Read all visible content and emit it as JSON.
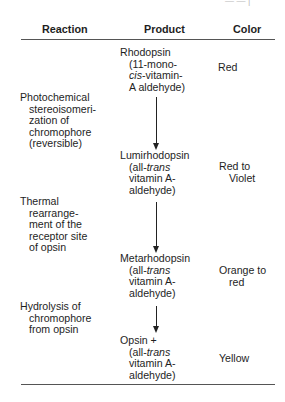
{
  "table": {
    "headers": {
      "reaction": "Reaction",
      "product": "Product",
      "color": "Color"
    },
    "products": [
      {
        "name": "Rhodopsin",
        "detail": [
          "(11-mono-",
          "cis-vitamin-",
          "A aldehyde)"
        ],
        "detail_italic_prefix": "cis",
        "color": [
          "Red"
        ]
      },
      {
        "name": "Lumirhodopsin",
        "detail": [
          "(all-trans",
          "vitamin A-",
          "aldehyde)"
        ],
        "color": [
          "Red to",
          "Violet"
        ]
      },
      {
        "name": "Metarhodopsin",
        "detail": [
          "(all-trans",
          "vitamin A-",
          "aldehyde)"
        ],
        "color": [
          "Orange to",
          "red"
        ]
      },
      {
        "name": "Opsin +",
        "detail": [
          "(all-trans",
          "vitamin A-",
          "aldehyde)"
        ],
        "color": [
          "Yellow"
        ]
      }
    ],
    "reactions": [
      {
        "lines": [
          "Photochemical",
          "stereoisomeri-",
          "zation of",
          "chromophore",
          "(reversible)"
        ]
      },
      {
        "lines": [
          "Thermal",
          "rearrange-",
          "ment of the",
          "receptor site",
          "of opsin"
        ]
      },
      {
        "lines": [
          "Hydrolysis of",
          "chromophore",
          "from opsin"
        ]
      }
    ],
    "italic_words": {
      "cis": "cis",
      "trans": "trans",
      "all_prefix": "(all-",
      "cis_suffix": "-vitamin-"
    }
  }
}
